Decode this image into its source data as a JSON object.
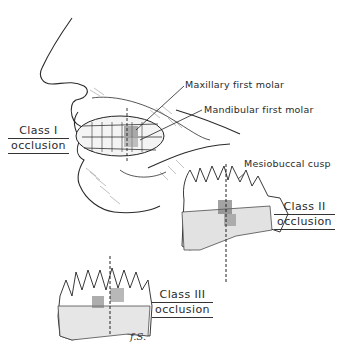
{
  "figure": {
    "labels": {
      "maxillary": "Maxillary first molar",
      "mandibular": "Mandibular first molar",
      "mesiobuccal": "Mesiobuccal cusp"
    },
    "classes": [
      {
        "line1": "Class I",
        "line2": "occlusion"
      },
      {
        "line1": "Class II",
        "line2": "occlusion"
      },
      {
        "line1": "Class III",
        "line2": "occlusion"
      }
    ],
    "signature": "f.S."
  }
}
